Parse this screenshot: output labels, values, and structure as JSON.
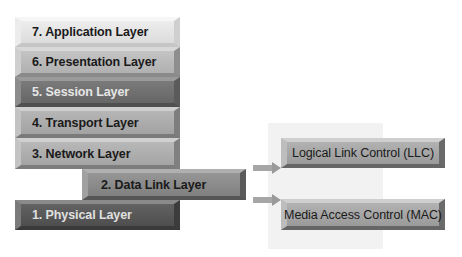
{
  "diagram": {
    "type": "osi-model",
    "layers": [
      {
        "number": 7,
        "label": "7. Application Layer"
      },
      {
        "number": 6,
        "label": "6. Presentation Layer"
      },
      {
        "number": 5,
        "label": "5. Session Layer"
      },
      {
        "number": 4,
        "label": "4. Transport Layer"
      },
      {
        "number": 3,
        "label": "3. Network Layer"
      },
      {
        "number": 2,
        "label": "2. Data Link Layer"
      },
      {
        "number": 1,
        "label": "1. Physical Layer"
      }
    ],
    "sublayers": [
      {
        "label": "Logical Link Control (LLC)"
      },
      {
        "label": "Media Access Control (MAC)"
      }
    ],
    "edges": [
      {
        "from": "2. Data Link Layer",
        "to": "Logical Link Control (LLC)"
      },
      {
        "from": "2. Data Link Layer",
        "to": "Media Access Control (MAC)"
      }
    ]
  }
}
